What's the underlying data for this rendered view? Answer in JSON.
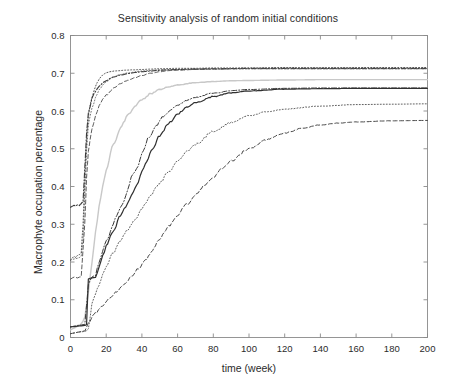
{
  "chart_data": {
    "type": "line",
    "title": "Sensitivity analysis of random initial conditions",
    "xlabel": "time (week)",
    "ylabel": "Macrophyte occupation percentage",
    "xlim": [
      0,
      200
    ],
    "ylim": [
      0,
      0.8
    ],
    "xticks": [
      0,
      20,
      40,
      60,
      80,
      100,
      120,
      140,
      160,
      180,
      200
    ],
    "xtick_labels": [
      "0",
      "20",
      "40",
      "60",
      "80",
      "100",
      "120",
      "140",
      "160",
      "180",
      "200"
    ],
    "yticks": [
      0,
      0.1,
      0.2,
      0.3,
      0.4,
      0.5,
      0.6,
      0.7,
      0.8
    ],
    "ytick_labels": [
      "0",
      "0.1",
      "0.2",
      "0.3",
      "0.4",
      "0.5",
      "0.6",
      "0.7",
      "0.8"
    ],
    "grid": false,
    "legend": "none",
    "box": true,
    "line_color": "#3a3a3a",
    "series": [
      {
        "name": "run-1",
        "style": "dotted",
        "color": "#444444",
        "width": 0.9,
        "plateau": 0.715,
        "x": [
          0,
          1,
          2,
          3,
          4,
          5,
          6,
          7,
          8,
          9,
          10,
          11,
          12,
          13,
          14,
          15,
          16,
          18,
          20,
          22,
          25,
          28,
          30,
          35,
          40,
          45,
          50,
          60,
          70,
          80,
          100,
          120,
          140,
          160,
          180,
          200
        ],
        "y": [
          0.205,
          0.21,
          0.215,
          0.212,
          0.218,
          0.22,
          0.225,
          0.3,
          0.42,
          0.52,
          0.585,
          0.615,
          0.635,
          0.652,
          0.665,
          0.675,
          0.684,
          0.695,
          0.701,
          0.704,
          0.706,
          0.707,
          0.708,
          0.709,
          0.71,
          0.711,
          0.712,
          0.713,
          0.713,
          0.714,
          0.714,
          0.715,
          0.715,
          0.715,
          0.715,
          0.715
        ]
      },
      {
        "name": "run-2",
        "style": "dashdot",
        "color": "#3a3a3a",
        "width": 1.1,
        "plateau": 0.713,
        "x": [
          0,
          1,
          2,
          3,
          4,
          5,
          6,
          7,
          8,
          9,
          10,
          12,
          14,
          16,
          18,
          20,
          24,
          28,
          32,
          36,
          40,
          45,
          50,
          55,
          60,
          70,
          80,
          100,
          120,
          140,
          160,
          180,
          200
        ],
        "y": [
          0.345,
          0.348,
          0.35,
          0.348,
          0.352,
          0.35,
          0.355,
          0.36,
          0.45,
          0.54,
          0.595,
          0.632,
          0.652,
          0.665,
          0.674,
          0.681,
          0.69,
          0.695,
          0.699,
          0.702,
          0.704,
          0.706,
          0.708,
          0.709,
          0.71,
          0.711,
          0.712,
          0.713,
          0.713,
          0.713,
          0.713,
          0.713,
          0.713
        ]
      },
      {
        "name": "run-3",
        "style": "dashed",
        "color": "#4a4a4a",
        "width": 0.9,
        "plateau": 0.712,
        "x": [
          0,
          2,
          4,
          6,
          8,
          9,
          10,
          11,
          12,
          14,
          16,
          18,
          20,
          24,
          28,
          32,
          36,
          40,
          45,
          50,
          55,
          60,
          70,
          80,
          100,
          120,
          140,
          160,
          180,
          200
        ],
        "y": [
          0.155,
          0.16,
          0.158,
          0.162,
          0.3,
          0.42,
          0.49,
          0.525,
          0.552,
          0.588,
          0.612,
          0.63,
          0.642,
          0.66,
          0.672,
          0.681,
          0.688,
          0.694,
          0.7,
          0.704,
          0.707,
          0.708,
          0.71,
          0.711,
          0.712,
          0.712,
          0.712,
          0.712,
          0.712,
          0.712
        ]
      },
      {
        "name": "run-4",
        "style": "solid-light",
        "color": "#c8c8c8",
        "width": 1.4,
        "plateau": 0.683,
        "x": [
          0,
          2,
          4,
          6,
          8,
          10,
          12,
          14,
          16,
          18,
          20,
          24,
          28,
          32,
          36,
          40,
          45,
          50,
          55,
          60,
          70,
          80,
          90,
          100,
          120,
          140,
          160,
          180,
          200
        ],
        "y": [
          0.02,
          0.025,
          0.03,
          0.035,
          0.055,
          0.12,
          0.2,
          0.28,
          0.345,
          0.4,
          0.445,
          0.51,
          0.555,
          0.588,
          0.612,
          0.63,
          0.646,
          0.657,
          0.664,
          0.669,
          0.675,
          0.678,
          0.68,
          0.681,
          0.682,
          0.683,
          0.683,
          0.683,
          0.683
        ]
      },
      {
        "name": "run-5",
        "style": "dashdot",
        "color": "#3a3a3a",
        "width": 1.0,
        "plateau": 0.661,
        "x": [
          0,
          2,
          4,
          6,
          8,
          10,
          12,
          14,
          16,
          18,
          20,
          24,
          26,
          28,
          30,
          32,
          34,
          36,
          38,
          40,
          44,
          48,
          52,
          56,
          60,
          65,
          70,
          80,
          90,
          100,
          120,
          140,
          160,
          180,
          200
        ],
        "y": [
          0.028,
          0.03,
          0.032,
          0.033,
          0.035,
          0.14,
          0.16,
          0.165,
          0.2,
          0.23,
          0.255,
          0.3,
          0.325,
          0.345,
          0.362,
          0.39,
          0.425,
          0.44,
          0.455,
          0.49,
          0.53,
          0.562,
          0.585,
          0.603,
          0.615,
          0.628,
          0.636,
          0.647,
          0.654,
          0.657,
          0.66,
          0.661,
          0.661,
          0.661,
          0.661
        ]
      },
      {
        "name": "run-6",
        "style": "solid",
        "color": "#303030",
        "width": 1.2,
        "plateau": 0.66,
        "x": [
          0,
          2,
          4,
          6,
          8,
          9,
          10,
          11,
          12,
          14,
          16,
          18,
          20,
          24,
          28,
          30,
          32,
          34,
          36,
          38,
          40,
          42,
          46,
          50,
          55,
          60,
          65,
          70,
          80,
          90,
          100,
          120,
          140,
          160,
          180,
          200
        ],
        "y": [
          0.028,
          0.029,
          0.03,
          0.031,
          0.032,
          0.033,
          0.155,
          0.157,
          0.158,
          0.16,
          0.185,
          0.215,
          0.242,
          0.282,
          0.322,
          0.34,
          0.355,
          0.375,
          0.395,
          0.41,
          0.44,
          0.462,
          0.5,
          0.535,
          0.568,
          0.592,
          0.61,
          0.622,
          0.638,
          0.648,
          0.653,
          0.658,
          0.659,
          0.66,
          0.66,
          0.66
        ]
      },
      {
        "name": "run-7",
        "style": "dotted",
        "color": "#505050",
        "width": 0.9,
        "plateau": 0.619,
        "x": [
          0,
          2,
          4,
          6,
          8,
          10,
          12,
          14,
          16,
          18,
          20,
          24,
          28,
          32,
          36,
          40,
          45,
          50,
          55,
          60,
          65,
          70,
          80,
          90,
          100,
          110,
          120,
          140,
          160,
          180,
          200
        ],
        "y": [
          0.01,
          0.012,
          0.014,
          0.015,
          0.016,
          0.02,
          0.09,
          0.115,
          0.14,
          0.165,
          0.19,
          0.225,
          0.258,
          0.285,
          0.312,
          0.342,
          0.378,
          0.41,
          0.44,
          0.468,
          0.492,
          0.512,
          0.545,
          0.57,
          0.587,
          0.598,
          0.605,
          0.613,
          0.617,
          0.618,
          0.619
        ]
      },
      {
        "name": "run-8",
        "style": "dashed",
        "color": "#4a4a4a",
        "width": 1.0,
        "plateau": 0.575,
        "x": [
          0,
          2,
          4,
          6,
          8,
          10,
          14,
          18,
          22,
          26,
          30,
          34,
          38,
          42,
          46,
          50,
          55,
          60,
          65,
          70,
          75,
          80,
          85,
          90,
          100,
          110,
          120,
          130,
          140,
          150,
          160,
          180,
          200
        ],
        "y": [
          0.01,
          0.012,
          0.014,
          0.016,
          0.018,
          0.04,
          0.065,
          0.085,
          0.105,
          0.122,
          0.14,
          0.16,
          0.182,
          0.205,
          0.232,
          0.262,
          0.295,
          0.325,
          0.352,
          0.378,
          0.402,
          0.425,
          0.448,
          0.468,
          0.5,
          0.524,
          0.542,
          0.554,
          0.563,
          0.568,
          0.571,
          0.574,
          0.575
        ]
      },
      {
        "name": "run-9",
        "style": "dotted",
        "color": "#555555",
        "width": 0.8,
        "plateau": 0.712,
        "x": [
          0,
          2,
          4,
          5,
          6,
          7,
          8,
          9,
          10,
          12,
          14,
          16,
          18,
          20,
          24,
          28,
          32,
          40,
          50,
          60,
          80,
          100,
          140,
          180,
          200
        ],
        "y": [
          0.205,
          0.208,
          0.21,
          0.212,
          0.215,
          0.26,
          0.38,
          0.49,
          0.56,
          0.608,
          0.635,
          0.655,
          0.668,
          0.678,
          0.69,
          0.697,
          0.701,
          0.706,
          0.709,
          0.71,
          0.711,
          0.712,
          0.712,
          0.712,
          0.712
        ]
      }
    ]
  },
  "axes": {
    "title": "Sensitivity analysis of random initial conditions",
    "x_axis_label": "time (week)",
    "y_axis_label": "Macrophyte occupation percentage"
  }
}
